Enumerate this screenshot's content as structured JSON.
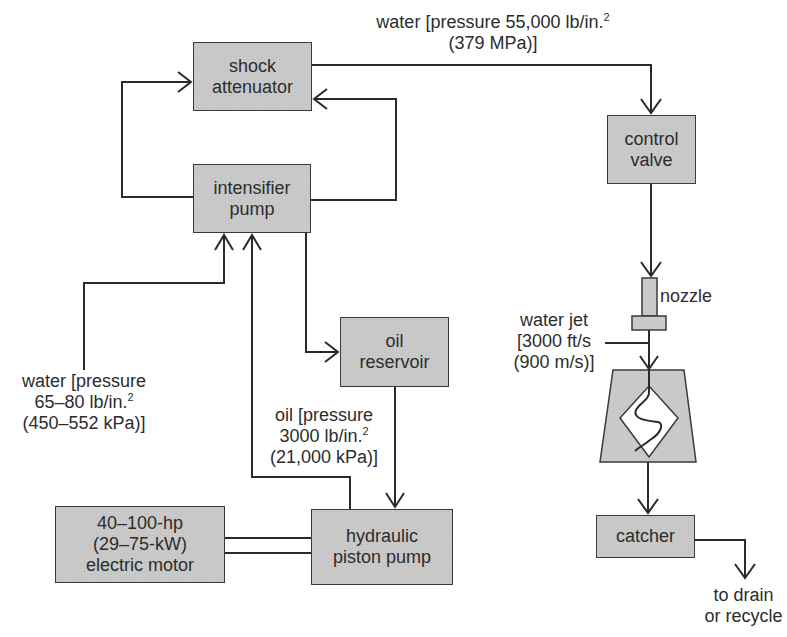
{
  "diagram": {
    "colors": {
      "box_fill": "#c9c9c9",
      "line": "#2a2a2a",
      "background": "#ffffff"
    },
    "components": {
      "shock_attenuator": {
        "line1": "shock",
        "line2": "attenuator"
      },
      "intensifier_pump": {
        "line1": "intensifier",
        "line2": "pump"
      },
      "oil_reservoir": {
        "line1": "oil",
        "line2": "reservoir"
      },
      "hydraulic_piston_pump": {
        "line1": "hydraulic",
        "line2": "piston pump"
      },
      "electric_motor": {
        "line1": "40–100-hp",
        "line2": "(29–75-kW)",
        "line3": "electric motor"
      },
      "control_valve": {
        "line1": "control",
        "line2": "valve"
      },
      "nozzle": {
        "label": "nozzle"
      },
      "catcher": {
        "label": "catcher"
      }
    },
    "annotations": {
      "high_pressure_water": {
        "line1": "water [pressure 55,000 lb/in.",
        "line1_sup": "2",
        "line2": "(379 MPa)]"
      },
      "inlet_water": {
        "line1": "water [pressure",
        "line2": "65–80 lb/in.",
        "line2_sup": "2",
        "line3": "(450–552 kPa)]"
      },
      "oil_pressure": {
        "line1": "oil [pressure",
        "line2": "3000 lb/in.",
        "line2_sup": "2",
        "line3": "(21,000 kPa)]"
      },
      "water_jet": {
        "line1": "water jet",
        "line2": "[3000 ft/s",
        "line3": "(900 m/s)]"
      },
      "drain": {
        "line1": "to drain",
        "line2": "or recycle"
      }
    }
  }
}
